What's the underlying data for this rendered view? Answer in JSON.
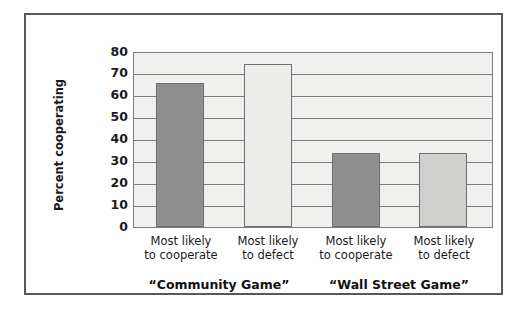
{
  "chart_data": {
    "type": "bar",
    "title": "",
    "subtitle": "",
    "xlabel": "",
    "ylabel": "Percent cooperating",
    "ylim": [
      0,
      80
    ],
    "yticks": [
      "0",
      "10",
      "20",
      "30",
      "40",
      "50",
      "60",
      "70",
      "80"
    ],
    "ytick_values": [
      0,
      10,
      20,
      30,
      40,
      50,
      60,
      70,
      80
    ],
    "grid": true,
    "legend": "none",
    "categories": [
      "Most likely to cooperate",
      "Most likely to defect",
      "Most likely to cooperate",
      "Most likely to defect"
    ],
    "category_lines": [
      {
        "line1": "Most likely",
        "line2": "to cooperate"
      },
      {
        "line1": "Most likely",
        "line2": "to defect"
      },
      {
        "line1": "Most likely",
        "line2": "to cooperate"
      },
      {
        "line1": "Most likely",
        "line2": "to defect"
      }
    ],
    "values": [
      66,
      75,
      34,
      34
    ],
    "bar_colors": [
      "#8f8f8f",
      "#ededeb",
      "#8f8f8f",
      "#cfcfcd"
    ],
    "groups": [
      {
        "label": "“Community Game”",
        "bar_indices": [
          0,
          1
        ]
      },
      {
        "label": "“Wall Street Game”",
        "bar_indices": [
          2,
          3
        ]
      }
    ]
  },
  "axis": {
    "y_title": "Percent cooperating"
  },
  "colors": {
    "frame": "#58585a",
    "plot_background": "#f0f0ee",
    "gridline": "#7c7c7e",
    "bar_dark": "#8f8f8f",
    "bar_lightest": "#ededeb",
    "bar_light": "#cfcfcd",
    "text": "#1b1b1b"
  },
  "groups": {
    "community": "“Community Game”",
    "wallstreet": "“Wall Street Game”"
  },
  "ticks": {
    "t80": "80",
    "t70": "70",
    "t60": "60",
    "t50": "50",
    "t40": "40",
    "t30": "30",
    "t20": "20",
    "t10": "10",
    "t0": "0"
  },
  "labels": {
    "most_likely": "Most likely",
    "to_cooperate": "to cooperate",
    "to_defect": "to defect"
  }
}
